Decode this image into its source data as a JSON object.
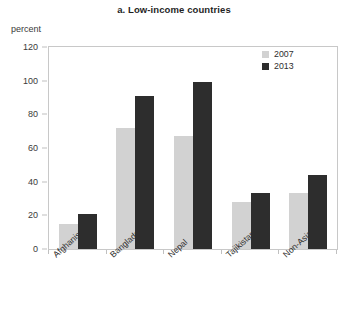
{
  "chart_data": {
    "type": "bar",
    "title": "a. Low-income countries",
    "ylabel": "percent",
    "xlabel": "",
    "ylim": [
      0,
      120
    ],
    "yticks": [
      0,
      20,
      40,
      60,
      80,
      100,
      120
    ],
    "grid": false,
    "legend_position": "top-right",
    "categories": [
      "Afghanistan",
      "Bangladesh",
      "Nepal",
      "Tajikistan",
      "Non-Asia PA"
    ],
    "series": [
      {
        "name": "2007",
        "color": "#d2d2d2",
        "values": [
          15,
          72,
          67,
          28,
          33
        ]
      },
      {
        "name": "2013",
        "color": "#2d2d2d",
        "values": [
          21,
          91,
          99,
          33,
          44
        ]
      }
    ]
  },
  "legend": {
    "items": [
      {
        "label": "2007"
      },
      {
        "label": "2013"
      }
    ]
  }
}
